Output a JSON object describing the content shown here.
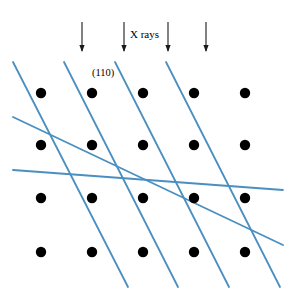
{
  "figure": {
    "background_color": "#ffffff",
    "width": 293,
    "height": 298
  },
  "labels": {
    "xrays": "X rays",
    "plane_index": "(110)"
  },
  "colors": {
    "plane_line": "#4a8fc0",
    "atom": "#000000",
    "arrow": "#1a1a1a",
    "text": "#000000"
  },
  "chart_data": {
    "type": "scatter",
    "xlabel": "",
    "ylabel": "",
    "xlim": [
      0,
      293
    ],
    "ylim": [
      0,
      298
    ],
    "grid": false,
    "legend_position": "none",
    "annotations": [
      {
        "text": "X rays",
        "x": 130,
        "y": 35
      },
      {
        "text": "(110)",
        "x": 92,
        "y": 76
      }
    ],
    "series": [
      {
        "name": "lattice atoms",
        "marker": "filled-circle",
        "marker_radius": 5.2,
        "color": "#000000",
        "points": [
          {
            "x": 41,
            "y": 93
          },
          {
            "x": 92,
            "y": 93
          },
          {
            "x": 143,
            "y": 93
          },
          {
            "x": 194,
            "y": 93
          },
          {
            "x": 245,
            "y": 93
          },
          {
            "x": 41,
            "y": 145
          },
          {
            "x": 92,
            "y": 145
          },
          {
            "x": 143,
            "y": 145
          },
          {
            "x": 194,
            "y": 145
          },
          {
            "x": 245,
            "y": 145
          },
          {
            "x": 41,
            "y": 198
          },
          {
            "x": 92,
            "y": 198
          },
          {
            "x": 143,
            "y": 198
          },
          {
            "x": 194,
            "y": 198
          },
          {
            "x": 245,
            "y": 198
          },
          {
            "x": 41,
            "y": 252
          },
          {
            "x": 92,
            "y": 252
          },
          {
            "x": 143,
            "y": 252
          },
          {
            "x": 194,
            "y": 252
          },
          {
            "x": 245,
            "y": 252
          }
        ]
      }
    ],
    "plane_lines": {
      "name": "(110) planes",
      "color": "#4a8fc0",
      "width": 1.8,
      "slope": 1,
      "segments": [
        {
          "x1": 13,
          "y1": 62,
          "x2": 128,
          "y2": 287
        },
        {
          "x1": 64,
          "y1": 62,
          "x2": 178,
          "y2": 287
        },
        {
          "x1": 115,
          "y1": 62,
          "x2": 229,
          "y2": 287
        },
        {
          "x1": 166,
          "y1": 62,
          "x2": 280,
          "y2": 287
        },
        {
          "x1": 13,
          "y1": 117,
          "x2": 283,
          "y2": 245
        },
        {
          "x1": 13,
          "y1": 170,
          "x2": 283,
          "y2": 190
        }
      ]
    },
    "arrows": {
      "name": "incident X-ray beams",
      "color": "#1a1a1a",
      "direction": "down",
      "count": 4,
      "items": [
        {
          "x": 82,
          "y_start": 22,
          "y_end": 52
        },
        {
          "x": 124,
          "y_start": 22,
          "y_end": 52
        },
        {
          "x": 168,
          "y_start": 22,
          "y_end": 52
        },
        {
          "x": 206,
          "y_start": 22,
          "y_end": 52
        }
      ]
    }
  }
}
